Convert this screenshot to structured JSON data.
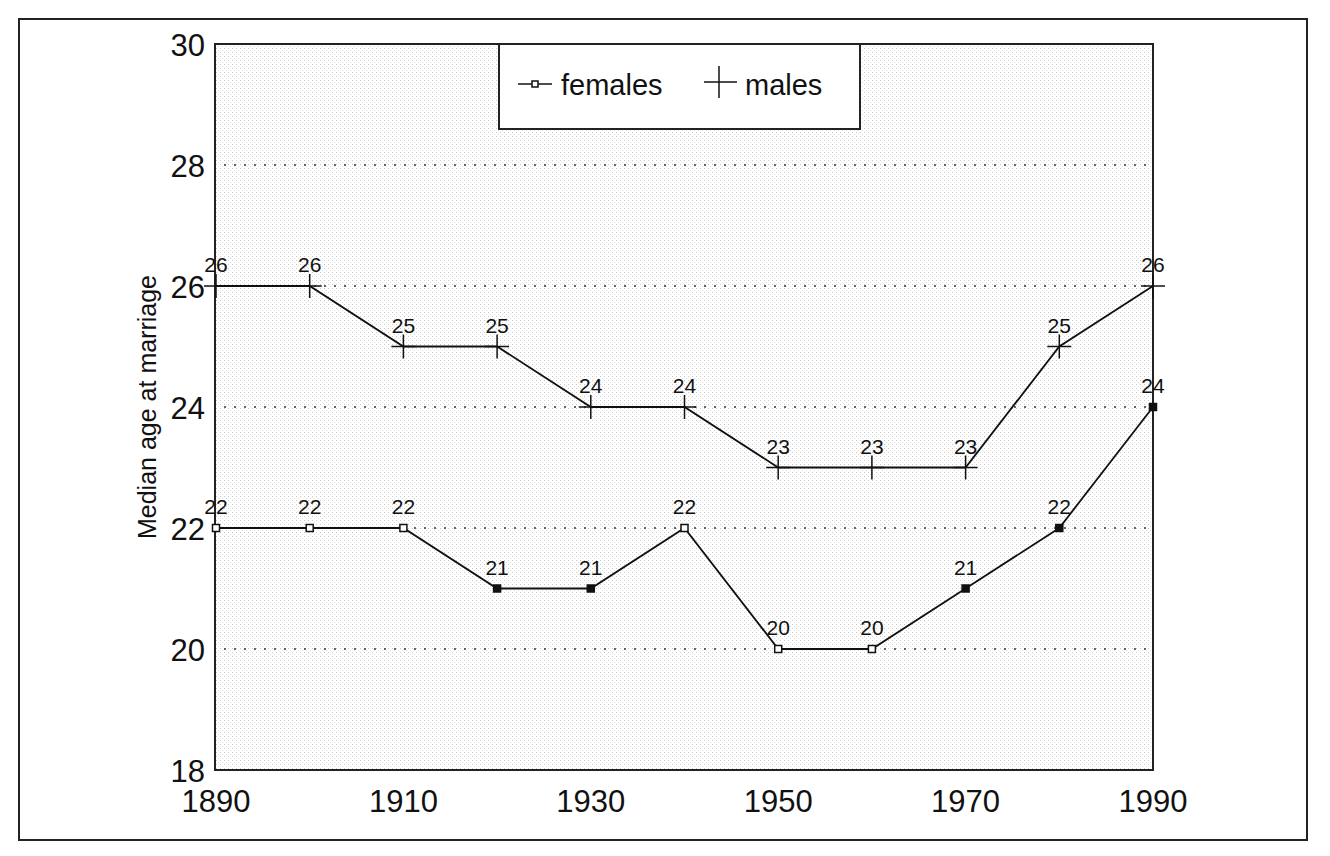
{
  "chart_data": {
    "type": "line",
    "title": "",
    "xlabel": "",
    "ylabel": "Median age at marriage",
    "x": [
      1890,
      1900,
      1910,
      1920,
      1930,
      1940,
      1950,
      1960,
      1970,
      1980,
      1990
    ],
    "x_tick_labels": [
      "1890",
      "1910",
      "1930",
      "1950",
      "1970",
      "1990"
    ],
    "y_tick_labels": [
      "18",
      "20",
      "22",
      "24",
      "26",
      "28",
      "30"
    ],
    "ylim": [
      18,
      30
    ],
    "xlim": [
      1890,
      1990
    ],
    "grid": "horizontal dotted at 20,22,24,26,28",
    "legend_position": "top-center",
    "data_labels": true,
    "series": [
      {
        "name": "females",
        "marker": "square",
        "values": [
          22,
          22,
          22,
          21,
          21,
          22,
          20,
          20,
          21,
          22,
          24
        ]
      },
      {
        "name": "males",
        "marker": "plus",
        "values": [
          26,
          26,
          25,
          25,
          24,
          24,
          23,
          23,
          23,
          25,
          26
        ]
      }
    ]
  },
  "legend": {
    "females_label": "females",
    "males_label": "males"
  },
  "axis": {
    "ylabel": "Median age at marriage"
  }
}
